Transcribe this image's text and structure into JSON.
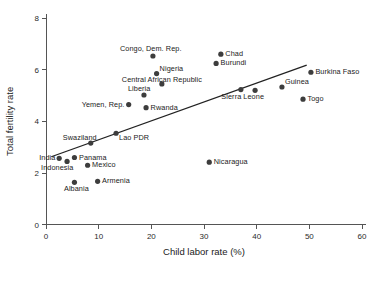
{
  "chart_data": {
    "type": "scatter",
    "title": "",
    "xlabel": "Child labor rate (%)",
    "ylabel": "Total fertility rate",
    "xlim": [
      0,
      60
    ],
    "ylim": [
      0,
      8
    ],
    "xticks": [
      0,
      10,
      20,
      30,
      40,
      50,
      60
    ],
    "yticks": [
      0,
      2,
      4,
      6,
      8
    ],
    "grid": false,
    "legend": "none",
    "trendline": {
      "label": "linear fit",
      "x_start": 1.0,
      "y_start": 2.63,
      "x_end": 49.5,
      "y_end": 6.18
    },
    "points": [
      {
        "label": "India",
        "x": 2.5,
        "y": 2.57,
        "label_pos": "left"
      },
      {
        "label": "Indonesia",
        "x": 4.0,
        "y": 2.45,
        "label_pos": "below-left"
      },
      {
        "label": "Panama",
        "x": 5.4,
        "y": 2.6,
        "label_pos": "right"
      },
      {
        "label": "Mexico",
        "x": 7.9,
        "y": 2.3,
        "label_pos": "right"
      },
      {
        "label": "Albania",
        "x": 5.4,
        "y": 1.64,
        "label_pos": "below"
      },
      {
        "label": "Armenia",
        "x": 9.8,
        "y": 1.68,
        "label_pos": "right"
      },
      {
        "label": "Swaziland",
        "x": 8.5,
        "y": 3.16,
        "label_pos": "above-left"
      },
      {
        "label": "Lao PDR",
        "x": 13.3,
        "y": 3.54,
        "label_pos": "below-right"
      },
      {
        "label": "Yemen, Rep.",
        "x": 15.7,
        "y": 4.65,
        "label_pos": "left"
      },
      {
        "label": "Liberia",
        "x": 18.6,
        "y": 5.02,
        "label_pos": "above-left"
      },
      {
        "label": "Rwanda",
        "x": 19.0,
        "y": 4.53,
        "label_pos": "right"
      },
      {
        "label": "Congo, Dem. Rep.",
        "x": 20.3,
        "y": 6.53,
        "label_pos": "above"
      },
      {
        "label": "Nigeria",
        "x": 21.0,
        "y": 5.85,
        "label_pos": "above-right"
      },
      {
        "label": "Central African Republic",
        "x": 22.0,
        "y": 5.45,
        "label_pos": "none"
      },
      {
        "label": "Nicaragua",
        "x": 31.0,
        "y": 2.42,
        "label_pos": "right"
      },
      {
        "label": "Burundi",
        "x": 32.3,
        "y": 6.24,
        "label_pos": "right"
      },
      {
        "label": "Chad",
        "x": 33.2,
        "y": 6.6,
        "label_pos": "right"
      },
      {
        "label": "Sierra Leone",
        "x": 37.0,
        "y": 5.23,
        "label_pos": "below"
      },
      {
        "label": "",
        "x": 39.7,
        "y": 5.2,
        "label_pos": "none"
      },
      {
        "label": "Guinea",
        "x": 44.8,
        "y": 5.33,
        "label_pos": "above-right"
      },
      {
        "label": "Togo",
        "x": 48.8,
        "y": 4.86,
        "label_pos": "right"
      },
      {
        "label": "Burkina Faso",
        "x": 50.3,
        "y": 5.9,
        "label_pos": "right"
      }
    ],
    "floating_labels": [
      {
        "text": "Central African Republic",
        "x": 22.0,
        "y": 5.6
      }
    ],
    "colors": {
      "point": "#3d3d3d",
      "line": "#222222",
      "axis": "#555555",
      "text": "#222222",
      "background": "#ffffff"
    }
  }
}
